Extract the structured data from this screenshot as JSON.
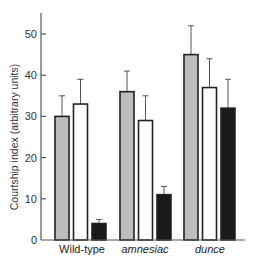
{
  "chart_data": {
    "type": "bar",
    "title": "",
    "xlabel": "",
    "ylabel": "Courtship index (arbitrary units)",
    "ylim": [
      0,
      55
    ],
    "yticks": [
      0,
      10,
      20,
      30,
      40,
      50
    ],
    "grid": false,
    "legend": null,
    "categories": [
      "Wild-type",
      "amnesiac",
      "dunce"
    ],
    "category_styles": [
      "normal",
      "italic",
      "italic"
    ],
    "series": [
      {
        "name": "gray",
        "color": "#bdbdbd",
        "values": [
          30,
          36,
          45
        ],
        "error_upper": [
          35,
          41,
          52
        ]
      },
      {
        "name": "white",
        "color": "#ffffff",
        "values": [
          33,
          29,
          37
        ],
        "error_upper": [
          39,
          35,
          44
        ]
      },
      {
        "name": "black",
        "color": "#1a1a1a",
        "values": [
          4,
          11,
          32
        ],
        "error_upper": [
          5,
          13,
          39
        ]
      }
    ]
  },
  "colors": {
    "axis": "#555555",
    "bar_outline": "#222222",
    "error_bar": "#555555"
  }
}
